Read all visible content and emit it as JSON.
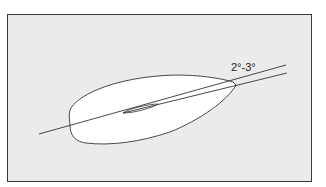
{
  "diagram": {
    "angle_label": "2°-3°",
    "colors": {
      "background": "#ebebeb",
      "shape_fill": "#ffffff",
      "stroke": "#333333"
    }
  }
}
